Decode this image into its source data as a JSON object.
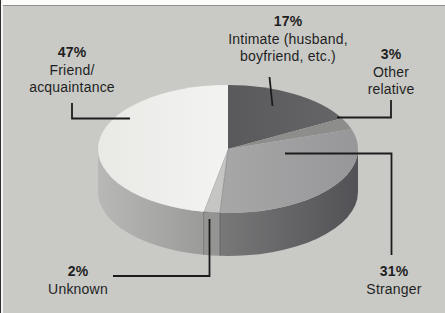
{
  "figure": {
    "background_color": "#c9cac6",
    "text_color": "#1f1f1f",
    "leader_line_color": "#1c1c1c",
    "scan_edge_top_color": "#fcfcfb",
    "scan_edge_top_rule_color": "#909090",
    "scan_edge_left_dark": "#2f2f2f",
    "scan_edge_left_light": "#f4f4f2"
  },
  "chart_data": {
    "type": "pie",
    "style": "3d-cylinder-pie",
    "legend": "none",
    "start_angle_clockwise_from_top_deg": 0,
    "slices": [
      {
        "name": "Intimate (husband, boyfriend, etc.)",
        "value_pct": 17,
        "pct_label": "17%",
        "label_lines": [
          "Intimate (husband,",
          "boyfriend, etc.)"
        ],
        "top_gradient": [
          "#4c4c4e",
          "#67676a"
        ]
      },
      {
        "name": "Other relative",
        "value_pct": 3,
        "pct_label": "3%",
        "label_lines": [
          "Other",
          "relative"
        ],
        "top_gradient": [
          "#8d8d8b"
        ]
      },
      {
        "name": "Stranger",
        "value_pct": 31,
        "pct_label": "31%",
        "label_lines": [
          "Stranger"
        ],
        "top_gradient": [
          "#b5b5b3",
          "#97979a"
        ],
        "side_gradient": [
          "#9a9a98",
          "#525256"
        ]
      },
      {
        "name": "Unknown",
        "value_pct": 2,
        "pct_label": "2%",
        "label_lines": [
          "Unknown"
        ],
        "top_gradient": [
          "#c5c5c3"
        ],
        "side_gradient": [
          "#949492"
        ]
      },
      {
        "name": "Friend/acquaintance",
        "value_pct": 47,
        "pct_label": "47%",
        "label_lines": [
          "Friend/",
          "acquaintance"
        ],
        "top_gradient": [
          "#e9e9e6",
          "#fdfdfc"
        ],
        "side_gradient": [
          "#b8b8b6",
          "#70706e"
        ]
      }
    ]
  }
}
